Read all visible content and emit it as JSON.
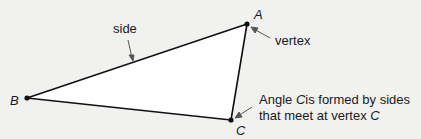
{
  "diagram": {
    "type": "triangle",
    "vertices": {
      "A": {
        "label": "A",
        "x": 247,
        "y": 24
      },
      "B": {
        "label": "B",
        "x": 27,
        "y": 98
      },
      "C": {
        "label": "C",
        "x": 231,
        "y": 120
      }
    },
    "annotations": {
      "side": "side",
      "vertex": "vertex",
      "angle_line1_pre": "Angle ",
      "angle_line1_var": "C",
      "angle_line1_post": "is formed by sides",
      "angle_line2_pre": "that meet at vertex ",
      "angle_line2_var": "C"
    },
    "colors": {
      "fill": "#ffffff",
      "stroke": "#111111",
      "arrow": "#666666",
      "background": "#f1f1f0"
    }
  }
}
